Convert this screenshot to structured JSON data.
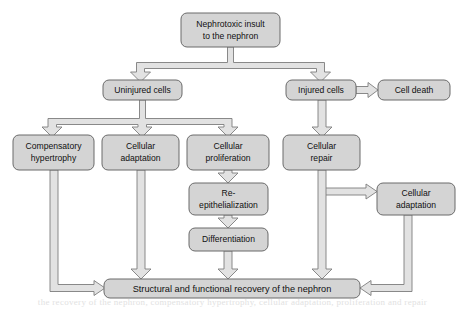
{
  "diagram": {
    "colors": {
      "node_fill": "#d4d4d4",
      "node_stroke": "#6a6a6a",
      "connector_fill": "#e2e2e2",
      "connector_stroke": "#7d7d7d",
      "background": "#ffffff",
      "text": "#101010"
    },
    "nodes": [
      {
        "id": "insult",
        "line1": "Nephrotoxic insult",
        "line2": "to the nephron"
      },
      {
        "id": "uninjured",
        "line1": "Uninjured cells",
        "line2": ""
      },
      {
        "id": "injured",
        "line1": "Injured cells",
        "line2": ""
      },
      {
        "id": "celldeath",
        "line1": "Cell death",
        "line2": ""
      },
      {
        "id": "hypertrophy",
        "line1": "Compensatory",
        "line2": "hypertrophy"
      },
      {
        "id": "adaptation_left",
        "line1": "Cellular",
        "line2": "adaptation"
      },
      {
        "id": "proliferation",
        "line1": "Cellular",
        "line2": "proliferation"
      },
      {
        "id": "repair",
        "line1": "Cellular",
        "line2": "repair"
      },
      {
        "id": "reepi",
        "line1": "Re-",
        "line2": "epithelialization"
      },
      {
        "id": "differentiation",
        "line1": "Differentiation",
        "line2": ""
      },
      {
        "id": "adaptation_right",
        "line1": "Cellular",
        "line2": "adaptation"
      },
      {
        "id": "recovery",
        "line1": "Structural and functional recovery of the nephron",
        "line2": ""
      }
    ],
    "edges": [
      {
        "from": "insult",
        "to": "uninjured"
      },
      {
        "from": "insult",
        "to": "injured"
      },
      {
        "from": "injured",
        "to": "celldeath"
      },
      {
        "from": "uninjured",
        "to": "hypertrophy"
      },
      {
        "from": "uninjured",
        "to": "adaptation_left"
      },
      {
        "from": "uninjured",
        "to": "proliferation"
      },
      {
        "from": "injured",
        "to": "repair"
      },
      {
        "from": "proliferation",
        "to": "reepi"
      },
      {
        "from": "reepi",
        "to": "differentiation"
      },
      {
        "from": "repair",
        "to": "adaptation_right"
      },
      {
        "from": "hypertrophy",
        "to": "recovery"
      },
      {
        "from": "adaptation_left",
        "to": "recovery"
      },
      {
        "from": "differentiation",
        "to": "recovery"
      },
      {
        "from": "repair",
        "to": "recovery"
      },
      {
        "from": "adaptation_right",
        "to": "recovery"
      }
    ],
    "caption_fragment": "the recovery of the nephron, compensatory hypertrophy, cellular adaptation, proliferation and repair"
  }
}
